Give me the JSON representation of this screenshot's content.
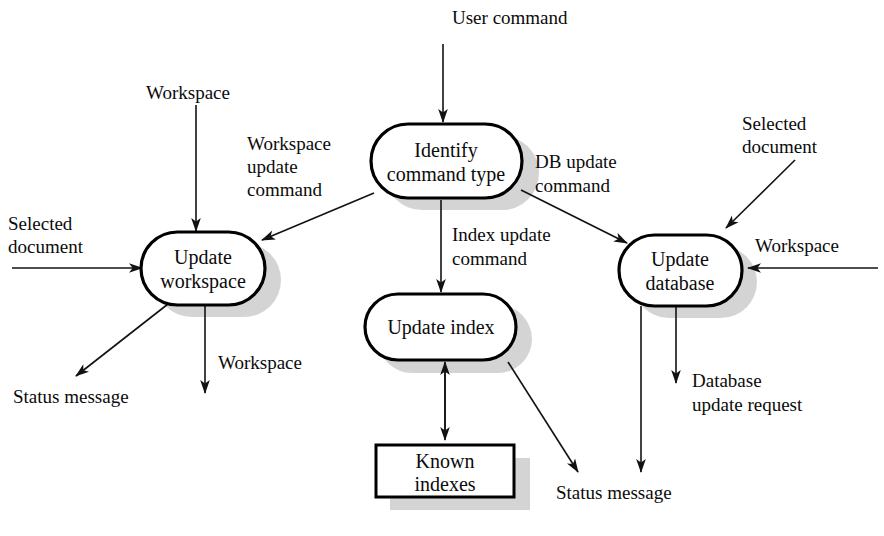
{
  "diagram": {
    "background_color": "#ffffff",
    "line_color": "#121212",
    "shadow_color": "#b9b9b9",
    "processes": [
      {
        "id": "update_workspace",
        "label_line1": "Update",
        "label_line2": "workspace",
        "x": 202,
        "y": 268
      },
      {
        "id": "identify_command",
        "label_line1": "Identify",
        "label_line2": "command type",
        "x": 445,
        "y": 161
      },
      {
        "id": "update_database",
        "label_line1": "Update",
        "label_line2": "database",
        "x": 679,
        "y": 270
      },
      {
        "id": "update_index",
        "label_line1": "Update index",
        "label_line2": "",
        "x": 440,
        "y": 326
      }
    ],
    "stores": [
      {
        "id": "known_indexes",
        "label_line1": "Known",
        "label_line2": "indexes",
        "x": 443,
        "y": 471
      }
    ],
    "flows": [
      {
        "id": "user_command",
        "label": "User command",
        "from": "external",
        "to": "identify_command"
      },
      {
        "id": "workspace_in_left",
        "label": "Workspace",
        "from": "external",
        "to": "update_workspace"
      },
      {
        "id": "selected_document_left",
        "label_line1": "Selected",
        "label_line2": "document",
        "from": "external",
        "to": "update_workspace"
      },
      {
        "id": "workspace_update_cmd",
        "label_line1": "Workspace",
        "label_line2": "update",
        "label_line3": "command",
        "from": "identify_command",
        "to": "update_workspace"
      },
      {
        "id": "index_update_cmd",
        "label_line1": "Index update",
        "label_line2": "command",
        "from": "identify_command",
        "to": "update_index"
      },
      {
        "id": "db_update_cmd",
        "label_line1": "DB update",
        "label_line2": "command",
        "from": "identify_command",
        "to": "update_database"
      },
      {
        "id": "selected_document_right",
        "label_line1": "Selected",
        "label_line2": "document",
        "from": "external",
        "to": "update_database"
      },
      {
        "id": "workspace_in_right",
        "label": "Workspace",
        "from": "external",
        "to": "update_database"
      },
      {
        "id": "status_message_left",
        "label": "Status message",
        "from": "update_workspace",
        "to": "external"
      },
      {
        "id": "workspace_out",
        "label": "Workspace",
        "from": "update_workspace",
        "to": "external"
      },
      {
        "id": "known_indexes_flow",
        "label": "",
        "from": "update_index",
        "to": "known_indexes",
        "bidirectional": true
      },
      {
        "id": "status_message_center",
        "label": "Status message",
        "from": "update_index",
        "to": "external"
      },
      {
        "id": "database_update_request",
        "label_line1": "Database",
        "label_line2": "update request",
        "from": "update_database",
        "to": "external"
      },
      {
        "id": "status_message_right",
        "label": "",
        "from": "update_database",
        "to": "external"
      }
    ],
    "labels": {
      "user_command": "User command",
      "workspace": "Workspace",
      "selected": "Selected",
      "document": "document",
      "workspace_word": "Workspace",
      "update_word": "update",
      "command_word": "command",
      "index_update": "Index update",
      "db_update": "DB update",
      "status_message": "Status message",
      "database": "Database",
      "update_request": "update request",
      "update": "Update",
      "workspace_node": "workspace",
      "identify": "Identify",
      "command_type": "command type",
      "database_node": "database",
      "update_index": "Update index",
      "known": "Known",
      "indexes": "indexes"
    }
  }
}
